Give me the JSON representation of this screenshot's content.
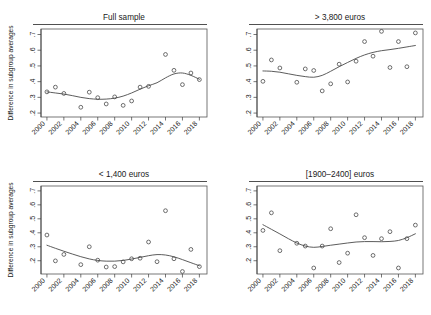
{
  "figure": {
    "width": 431,
    "height": 315,
    "background": "#ffffff",
    "ylabel": "Difference in subgroup averages",
    "line_color": "#4a4a4a",
    "point_color": "#4a4a4a",
    "axis_color": "#3c3c3c"
  },
  "chart_data": [
    {
      "type": "scatter",
      "panel": "top-left",
      "title": "Full sample",
      "xlabel": "",
      "ylabel": "Difference in subgroup averages",
      "xlim": [
        1999.3,
        2018.9
      ],
      "ylim": [
        0.175,
        0.735
      ],
      "grid": false,
      "legend": "none",
      "xticks": [
        2000,
        2002,
        2004,
        2006,
        2008,
        2010,
        2012,
        2014,
        2016,
        2018
      ],
      "xtick_labels": [
        "2000",
        "2002",
        "2004",
        "2006",
        "2008",
        "2010",
        "2012",
        "2014",
        "2016",
        "2018"
      ],
      "yticks": [
        0.2,
        0.3,
        0.4,
        0.5,
        0.6,
        0.7
      ],
      "ytick_labels": [
        ".2",
        ".3",
        ".4",
        ".5",
        ".6",
        ".7"
      ],
      "x": [
        2000,
        2001,
        2002,
        2004,
        2005,
        2006,
        2007,
        2008,
        2009,
        2010,
        2011,
        2012,
        2014,
        2015,
        2016,
        2017,
        2018
      ],
      "y": [
        0.335,
        0.365,
        0.325,
        0.237,
        0.333,
        0.298,
        0.258,
        0.303,
        0.249,
        0.277,
        0.365,
        0.37,
        0.573,
        0.472,
        0.381,
        0.455,
        0.413
      ],
      "series": [
        {
          "name": "observed",
          "kind": "scatter",
          "x": [
            2000,
            2001,
            2002,
            2004,
            2005,
            2006,
            2007,
            2008,
            2009,
            2010,
            2011,
            2012,
            2014,
            2015,
            2016,
            2017,
            2018
          ],
          "values": [
            0.335,
            0.365,
            0.325,
            0.237,
            0.333,
            0.298,
            0.258,
            0.303,
            0.249,
            0.277,
            0.365,
            0.37,
            0.573,
            0.472,
            0.381,
            0.455,
            0.413
          ]
        },
        {
          "name": "smoothed-trend",
          "kind": "line",
          "x": [
            2000,
            2001,
            2002,
            2003,
            2004,
            2005,
            2006,
            2007,
            2008,
            2009,
            2010,
            2011,
            2012,
            2013,
            2014,
            2015,
            2016,
            2017,
            2018
          ],
          "values": [
            0.335,
            0.328,
            0.321,
            0.311,
            0.3,
            0.292,
            0.288,
            0.289,
            0.295,
            0.308,
            0.328,
            0.352,
            0.374,
            0.393,
            0.424,
            0.449,
            0.455,
            0.44,
            0.415
          ]
        }
      ]
    },
    {
      "type": "scatter",
      "panel": "top-right",
      "title": "> 3,800 euros",
      "xlabel": "",
      "ylabel": "",
      "xlim": [
        1999.3,
        2018.9
      ],
      "ylim": [
        0.175,
        0.735
      ],
      "grid": false,
      "legend": "none",
      "xticks": [
        2000,
        2002,
        2004,
        2006,
        2008,
        2010,
        2012,
        2014,
        2016,
        2018
      ],
      "xtick_labels": [
        "2000",
        "2002",
        "2004",
        "2006",
        "2008",
        "2010",
        "2012",
        "2014",
        "2016",
        "2018"
      ],
      "yticks": [
        0.2,
        0.3,
        0.4,
        0.5,
        0.6,
        0.7
      ],
      "ytick_labels": [
        ".2",
        ".3",
        ".4",
        ".5",
        ".6",
        ".7"
      ],
      "x": [
        2000,
        2001,
        2002,
        2004,
        2005,
        2006,
        2007,
        2008,
        2009,
        2010,
        2011,
        2012,
        2013,
        2014,
        2015,
        2016,
        2018
      ],
      "y": [
        0.402,
        0.538,
        0.487,
        0.396,
        0.481,
        0.471,
        0.341,
        0.386,
        0.511,
        0.398,
        0.53,
        0.655,
        0.562,
        0.72,
        0.49,
        0.655,
        0.495,
        0.71
      ],
      "series": [
        {
          "name": "observed",
          "kind": "scatter",
          "x": [
            2000,
            2001,
            2002,
            2004,
            2005,
            2006,
            2007,
            2008,
            2009,
            2010,
            2011,
            2012,
            2013,
            2014,
            2015,
            2016,
            2017,
            2018
          ],
          "values": [
            0.402,
            0.538,
            0.487,
            0.396,
            0.481,
            0.471,
            0.341,
            0.386,
            0.511,
            0.398,
            0.53,
            0.655,
            0.562,
            0.72,
            0.49,
            0.655,
            0.495,
            0.71
          ]
        },
        {
          "name": "smoothed-trend",
          "kind": "line",
          "x": [
            2000,
            2001,
            2002,
            2003,
            2004,
            2005,
            2006,
            2007,
            2008,
            2009,
            2010,
            2011,
            2012,
            2013,
            2014,
            2015,
            2016,
            2017,
            2018
          ],
          "values": [
            0.468,
            0.466,
            0.46,
            0.45,
            0.44,
            0.432,
            0.428,
            0.44,
            0.466,
            0.495,
            0.522,
            0.548,
            0.57,
            0.586,
            0.597,
            0.604,
            0.612,
            0.621,
            0.63
          ]
        }
      ]
    },
    {
      "type": "scatter",
      "panel": "bottom-left",
      "title": "< 1,400 euros",
      "xlabel": "",
      "ylabel": "Difference in subgroup averages",
      "xlim": [
        1999.3,
        2018.9
      ],
      "ylim": [
        0.105,
        0.735
      ],
      "grid": false,
      "legend": "none",
      "xticks": [
        2000,
        2002,
        2004,
        2006,
        2008,
        2010,
        2012,
        2014,
        2016,
        2018
      ],
      "xtick_labels": [
        "2000",
        "2002",
        "2004",
        "2006",
        "2008",
        "2010",
        "2012",
        "2014",
        "2016",
        "2018"
      ],
      "yticks": [
        0.2,
        0.3,
        0.4,
        0.5,
        0.6,
        0.7
      ],
      "ytick_labels": [
        ".2",
        ".3",
        ".4",
        ".5",
        ".6",
        ".7"
      ],
      "x": [
        2000,
        2001,
        2002,
        2004,
        2005,
        2006,
        2007,
        2008,
        2009,
        2010,
        2011,
        2012,
        2014,
        2015,
        2016,
        2017,
        2018
      ],
      "y": [
        0.384,
        0.199,
        0.245,
        0.172,
        0.3,
        0.204,
        0.155,
        0.158,
        0.192,
        0.214,
        0.218,
        0.334,
        0.193,
        0.558,
        0.214,
        0.123,
        0.281,
        0.158
      ],
      "series": [
        {
          "name": "observed",
          "kind": "scatter",
          "x": [
            2000,
            2001,
            2002,
            2004,
            2005,
            2006,
            2007,
            2008,
            2009,
            2010,
            2011,
            2012,
            2013,
            2014,
            2015,
            2016,
            2017,
            2018
          ],
          "values": [
            0.384,
            0.199,
            0.245,
            0.172,
            0.3,
            0.204,
            0.155,
            0.158,
            0.192,
            0.214,
            0.218,
            0.334,
            0.193,
            0.558,
            0.214,
            0.123,
            0.281,
            0.158
          ]
        },
        {
          "name": "smoothed-trend",
          "kind": "line",
          "x": [
            2000,
            2001,
            2002,
            2003,
            2004,
            2005,
            2006,
            2007,
            2008,
            2009,
            2010,
            2011,
            2012,
            2013,
            2014,
            2015,
            2016,
            2017,
            2018
          ],
          "values": [
            0.311,
            0.289,
            0.268,
            0.248,
            0.229,
            0.213,
            0.202,
            0.197,
            0.197,
            0.202,
            0.212,
            0.224,
            0.236,
            0.244,
            0.241,
            0.228,
            0.208,
            0.186,
            0.164
          ]
        }
      ]
    },
    {
      "type": "scatter",
      "panel": "bottom-right",
      "title": "[1900–2400] euros",
      "xlabel": "",
      "ylabel": "",
      "xlim": [
        1999.3,
        2018.9
      ],
      "ylim": [
        0.105,
        0.735
      ],
      "grid": false,
      "legend": "none",
      "xticks": [
        2000,
        2002,
        2004,
        2006,
        2008,
        2010,
        2012,
        2014,
        2016,
        2018
      ],
      "xtick_labels": [
        "2000",
        "2002",
        "2004",
        "2006",
        "2008",
        "2010",
        "2012",
        "2014",
        "2016",
        "2018"
      ],
      "yticks": [
        0.2,
        0.3,
        0.4,
        0.5,
        0.6,
        0.7
      ],
      "ytick_labels": [
        ".2",
        ".3",
        ".4",
        ".5",
        ".6",
        ".7"
      ],
      "x": [
        2000,
        2001,
        2002,
        2004,
        2005,
        2006,
        2007,
        2008,
        2009,
        2010,
        2011,
        2012,
        2013,
        2014,
        2015,
        2016,
        2017,
        2018
      ],
      "y": [
        0.417,
        0.543,
        0.272,
        0.325,
        0.305,
        0.148,
        0.305,
        0.429,
        0.187,
        0.254,
        0.529,
        0.365,
        0.238,
        0.358,
        0.408,
        0.148,
        0.358,
        0.455
      ],
      "series": [
        {
          "name": "observed",
          "kind": "scatter",
          "x": [
            2000,
            2001,
            2002,
            2004,
            2005,
            2006,
            2007,
            2008,
            2009,
            2010,
            2011,
            2012,
            2013,
            2014,
            2015,
            2016,
            2017,
            2018
          ],
          "values": [
            0.417,
            0.543,
            0.272,
            0.325,
            0.305,
            0.148,
            0.305,
            0.429,
            0.187,
            0.254,
            0.529,
            0.365,
            0.238,
            0.358,
            0.408,
            0.148,
            0.358,
            0.455
          ]
        },
        {
          "name": "smoothed-trend",
          "kind": "line",
          "x": [
            2000,
            2001,
            2002,
            2003,
            2004,
            2005,
            2006,
            2007,
            2008,
            2009,
            2010,
            2011,
            2012,
            2013,
            2014,
            2015,
            2016,
            2017,
            2018
          ],
          "values": [
            0.458,
            0.425,
            0.392,
            0.358,
            0.327,
            0.305,
            0.296,
            0.302,
            0.311,
            0.319,
            0.327,
            0.334,
            0.337,
            0.337,
            0.336,
            0.338,
            0.345,
            0.365,
            0.393
          ]
        }
      ]
    }
  ]
}
